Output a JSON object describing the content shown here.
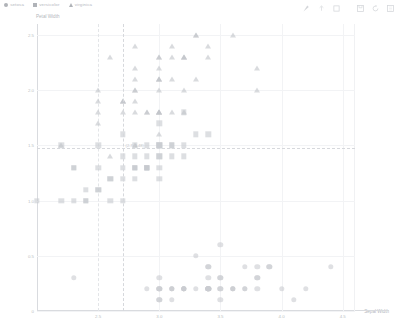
{
  "legend": {
    "items": [
      {
        "label": "setosa",
        "shape": "circle",
        "color": "#b0b3b8"
      },
      {
        "label": "versicolor",
        "shape": "square",
        "color": "#b0b3b8"
      },
      {
        "label": "virginica",
        "shape": "triangle",
        "color": "#b0b3b8"
      }
    ]
  },
  "toolbar": {
    "buttons": [
      {
        "name": "pan-icon",
        "title": "Pan"
      },
      {
        "name": "box-select-icon",
        "title": "Box Select"
      },
      {
        "name": "crosshair-icon",
        "title": "Crosshair"
      },
      {
        "name": "save-icon",
        "title": "Save"
      },
      {
        "name": "reset-icon",
        "title": "Reset"
      },
      {
        "name": "help-icon",
        "title": "Help"
      }
    ]
  },
  "crosshair": {
    "readout": "(2.7, 1.48)",
    "x_value": 2.7,
    "y_value": 1.48
  },
  "chart_data": {
    "type": "scatter",
    "title": "",
    "xlabel": "Sepal Width",
    "ylabel": "Petal Width",
    "xlim": [
      2.0,
      4.6
    ],
    "ylim": [
      0.0,
      2.6
    ],
    "xticks": [
      2.5,
      3.0,
      3.5,
      4.0,
      4.5
    ],
    "xticklabels": [
      "2.5",
      "3.0",
      "3.5",
      "4.0",
      "4.5"
    ],
    "yticks": [
      0,
      0.5,
      1.0,
      1.5,
      2.0,
      2.5
    ],
    "yticklabels": [
      "0",
      "0.5",
      "1.0",
      "1.5",
      "2.0",
      "2.5"
    ],
    "grid": true,
    "legend_position": "top-left",
    "series": [
      {
        "name": "setosa",
        "marker": "circle",
        "color": "#c9ccd1",
        "points": [
          [
            3.5,
            0.2
          ],
          [
            3.0,
            0.2
          ],
          [
            3.2,
            0.2
          ],
          [
            3.1,
            0.2
          ],
          [
            3.6,
            0.2
          ],
          [
            3.9,
            0.4
          ],
          [
            3.4,
            0.3
          ],
          [
            3.4,
            0.2
          ],
          [
            2.9,
            0.2
          ],
          [
            3.1,
            0.1
          ],
          [
            3.7,
            0.2
          ],
          [
            3.4,
            0.2
          ],
          [
            3.0,
            0.1
          ],
          [
            3.0,
            0.1
          ],
          [
            4.0,
            0.2
          ],
          [
            4.4,
            0.4
          ],
          [
            3.9,
            0.4
          ],
          [
            3.5,
            0.3
          ],
          [
            3.8,
            0.3
          ],
          [
            3.8,
            0.3
          ],
          [
            3.4,
            0.2
          ],
          [
            3.7,
            0.4
          ],
          [
            3.6,
            0.2
          ],
          [
            3.3,
            0.5
          ],
          [
            3.4,
            0.2
          ],
          [
            3.0,
            0.2
          ],
          [
            3.4,
            0.4
          ],
          [
            3.5,
            0.2
          ],
          [
            3.4,
            0.2
          ],
          [
            3.2,
            0.2
          ],
          [
            3.1,
            0.2
          ],
          [
            3.4,
            0.4
          ],
          [
            4.1,
            0.1
          ],
          [
            4.2,
            0.2
          ],
          [
            3.1,
            0.2
          ],
          [
            3.2,
            0.2
          ],
          [
            3.5,
            0.1
          ],
          [
            3.6,
            0.2
          ],
          [
            3.0,
            0.2
          ],
          [
            3.4,
            0.2
          ],
          [
            3.5,
            0.3
          ],
          [
            2.3,
            0.3
          ],
          [
            3.2,
            0.2
          ],
          [
            3.5,
            0.6
          ],
          [
            3.8,
            0.4
          ],
          [
            3.0,
            0.3
          ],
          [
            3.8,
            0.2
          ],
          [
            3.2,
            0.2
          ],
          [
            3.7,
            0.2
          ],
          [
            3.3,
            0.2
          ]
        ]
      },
      {
        "name": "versicolor",
        "marker": "square",
        "color": "#c6c9ce",
        "points": [
          [
            3.2,
            1.4
          ],
          [
            3.2,
            1.5
          ],
          [
            3.1,
            1.5
          ],
          [
            2.3,
            1.3
          ],
          [
            2.8,
            1.5
          ],
          [
            2.8,
            1.3
          ],
          [
            3.3,
            1.6
          ],
          [
            2.4,
            1.0
          ],
          [
            2.9,
            1.3
          ],
          [
            2.7,
            1.4
          ],
          [
            2.0,
            1.0
          ],
          [
            3.0,
            1.5
          ],
          [
            2.2,
            1.0
          ],
          [
            2.9,
            1.4
          ],
          [
            2.9,
            1.3
          ],
          [
            3.1,
            1.4
          ],
          [
            3.0,
            1.5
          ],
          [
            2.7,
            1.0
          ],
          [
            2.2,
            1.5
          ],
          [
            2.5,
            1.1
          ],
          [
            3.2,
            1.8
          ],
          [
            2.8,
            1.3
          ],
          [
            2.5,
            1.5
          ],
          [
            2.8,
            1.2
          ],
          [
            2.9,
            1.3
          ],
          [
            3.0,
            1.4
          ],
          [
            2.8,
            1.4
          ],
          [
            3.0,
            1.7
          ],
          [
            2.9,
            1.5
          ],
          [
            2.6,
            1.0
          ],
          [
            2.4,
            1.1
          ],
          [
            2.4,
            1.0
          ],
          [
            2.7,
            1.2
          ],
          [
            2.7,
            1.6
          ],
          [
            3.0,
            1.5
          ],
          [
            3.4,
            1.6
          ],
          [
            3.1,
            1.5
          ],
          [
            2.3,
            1.3
          ],
          [
            3.0,
            1.3
          ],
          [
            2.5,
            1.3
          ],
          [
            2.6,
            1.2
          ],
          [
            3.0,
            1.4
          ],
          [
            2.6,
            1.2
          ],
          [
            2.3,
            1.0
          ],
          [
            2.7,
            1.3
          ],
          [
            3.0,
            1.2
          ],
          [
            2.9,
            1.3
          ],
          [
            2.9,
            1.3
          ],
          [
            2.5,
            1.1
          ],
          [
            2.8,
            1.3
          ]
        ]
      },
      {
        "name": "virginica",
        "marker": "triangle",
        "color": "#c2c5ca",
        "points": [
          [
            3.3,
            2.5
          ],
          [
            2.7,
            1.9
          ],
          [
            3.0,
            2.1
          ],
          [
            2.9,
            1.8
          ],
          [
            3.0,
            2.2
          ],
          [
            3.0,
            2.1
          ],
          [
            2.5,
            1.7
          ],
          [
            2.9,
            1.8
          ],
          [
            2.5,
            1.8
          ],
          [
            3.6,
            2.5
          ],
          [
            3.2,
            2.0
          ],
          [
            2.7,
            1.9
          ],
          [
            3.0,
            2.1
          ],
          [
            2.5,
            2.0
          ],
          [
            2.8,
            2.4
          ],
          [
            3.2,
            2.3
          ],
          [
            3.0,
            1.8
          ],
          [
            3.8,
            2.2
          ],
          [
            2.6,
            2.3
          ],
          [
            2.2,
            1.5
          ],
          [
            3.2,
            2.3
          ],
          [
            2.8,
            2.0
          ],
          [
            2.8,
            2.0
          ],
          [
            2.7,
            1.8
          ],
          [
            3.3,
            2.1
          ],
          [
            3.2,
            1.8
          ],
          [
            2.8,
            1.8
          ],
          [
            3.0,
            1.8
          ],
          [
            2.8,
            2.1
          ],
          [
            3.0,
            1.6
          ],
          [
            2.8,
            1.9
          ],
          [
            3.8,
            2.0
          ],
          [
            2.8,
            2.2
          ],
          [
            2.8,
            1.5
          ],
          [
            2.6,
            1.4
          ],
          [
            3.0,
            2.3
          ],
          [
            3.4,
            2.4
          ],
          [
            3.1,
            1.8
          ],
          [
            3.0,
            1.8
          ],
          [
            3.1,
            2.1
          ],
          [
            3.1,
            2.4
          ],
          [
            3.1,
            2.3
          ],
          [
            2.7,
            1.9
          ],
          [
            3.2,
            2.3
          ],
          [
            3.3,
            2.5
          ],
          [
            3.0,
            2.3
          ],
          [
            2.5,
            1.9
          ],
          [
            3.0,
            2.0
          ],
          [
            3.4,
            2.3
          ],
          [
            3.0,
            1.8
          ]
        ]
      }
    ]
  }
}
